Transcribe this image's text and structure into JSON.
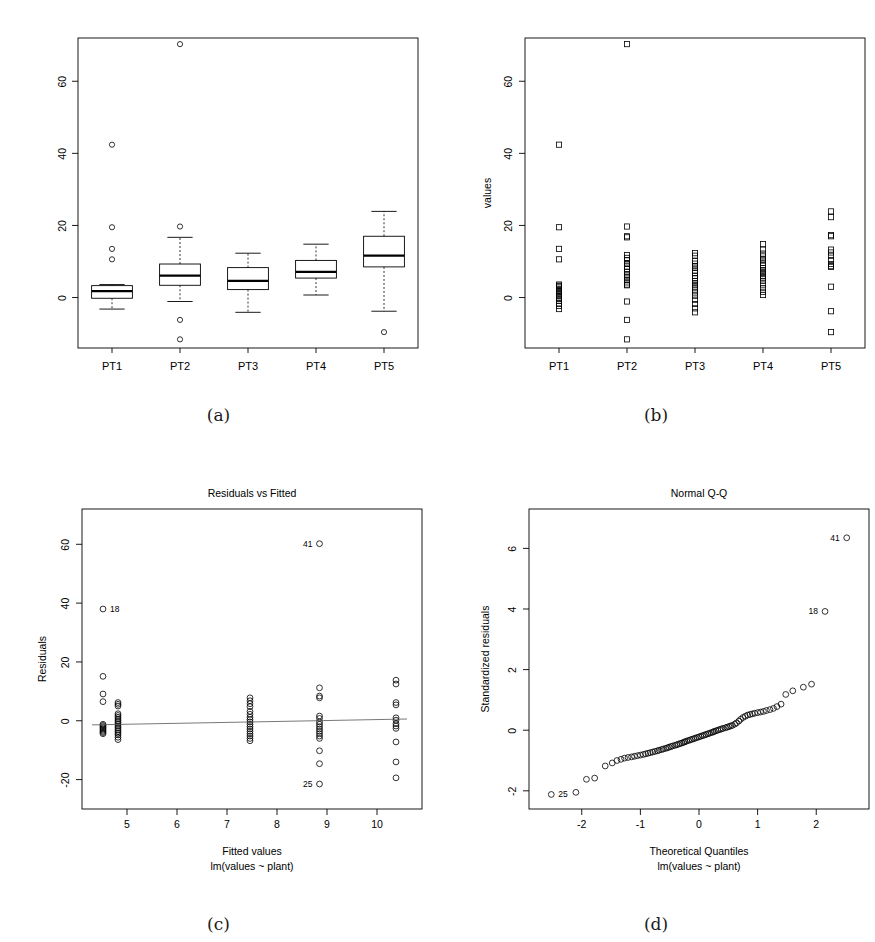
{
  "figure": {
    "caption_a": "(a)",
    "caption_b": "(b)",
    "caption_c": "(c)",
    "caption_d": "(d)"
  },
  "chart_data": [
    {
      "panel": "a",
      "type": "box",
      "title": "",
      "xlabel": "",
      "ylabel": "",
      "categories": [
        "PT1",
        "PT2",
        "PT3",
        "PT4",
        "PT5"
      ],
      "ylim": [
        -14,
        72
      ],
      "yticks": [
        0,
        20,
        40,
        60
      ],
      "ytick_labels": [
        "0",
        "20",
        "40",
        "60"
      ],
      "grid": false,
      "boxes": [
        {
          "category": "PT1",
          "lower_whisker": -3.2,
          "q1": -0.2,
          "median": 1.8,
          "q3": 3.3,
          "upper_whisker": 3.6,
          "outliers": [
            42.4,
            19.5,
            13.5,
            10.6
          ]
        },
        {
          "category": "PT2",
          "lower_whisker": -1.1,
          "q1": 3.4,
          "median": 6.1,
          "q3": 9.3,
          "upper_whisker": 16.7,
          "outliers": [
            70.3,
            19.7,
            -6.2,
            -11.6
          ]
        },
        {
          "category": "PT3",
          "lower_whisker": -4.1,
          "q1": 2.2,
          "median": 4.6,
          "q3": 8.3,
          "upper_whisker": 12.3,
          "outliers": []
        },
        {
          "category": "PT4",
          "lower_whisker": 0.7,
          "q1": 5.4,
          "median": 7.1,
          "q3": 10.3,
          "upper_whisker": 14.8,
          "outliers": []
        },
        {
          "category": "PT5",
          "lower_whisker": -3.8,
          "q1": 8.5,
          "median": 11.6,
          "q3": 17.0,
          "upper_whisker": 23.9,
          "outliers": [
            -9.6
          ]
        }
      ]
    },
    {
      "panel": "b",
      "type": "scatter",
      "title": "",
      "xlabel": "",
      "ylabel": "values",
      "categories": [
        "PT1",
        "PT2",
        "PT3",
        "PT4",
        "PT5"
      ],
      "ylim": [
        -14,
        72
      ],
      "yticks": [
        0,
        20,
        40,
        60
      ],
      "ytick_labels": [
        "0",
        "20",
        "40",
        "60"
      ],
      "grid": false,
      "marker": "square",
      "series": [
        {
          "name": "PT1",
          "values": [
            42.4,
            19.5,
            13.5,
            10.6,
            3.6,
            3.3,
            3.1,
            2.8,
            2.4,
            2.0,
            1.8,
            1.6,
            1.2,
            0.8,
            0.4,
            0.0,
            -0.4,
            -0.9,
            -1.6,
            -2.3,
            -3.2
          ]
        },
        {
          "name": "PT2",
          "values": [
            70.3,
            19.7,
            17.0,
            16.7,
            11.8,
            11.0,
            10.3,
            9.5,
            9.3,
            8.6,
            7.9,
            7.1,
            6.4,
            6.1,
            5.5,
            4.8,
            4.2,
            3.6,
            3.4,
            -1.1,
            -6.2,
            -11.6
          ]
        },
        {
          "name": "PT3",
          "values": [
            12.3,
            11.6,
            10.2,
            9.4,
            8.7,
            8.3,
            7.5,
            6.8,
            6.0,
            5.3,
            4.6,
            4.0,
            3.4,
            2.8,
            2.2,
            1.4,
            0.5,
            -0.6,
            -1.8,
            -3.0,
            -4.1
          ]
        },
        {
          "name": "PT4",
          "values": [
            14.8,
            13.3,
            12.2,
            11.4,
            10.6,
            10.3,
            9.6,
            8.9,
            8.2,
            7.6,
            7.1,
            6.5,
            5.9,
            5.4,
            4.6,
            3.6,
            2.6,
            1.6,
            0.7
          ]
        },
        {
          "name": "PT5",
          "values": [
            23.9,
            22.3,
            17.3,
            17.0,
            13.3,
            12.5,
            11.6,
            10.4,
            9.3,
            8.7,
            8.5,
            3.0,
            -3.8,
            -9.6
          ]
        }
      ]
    },
    {
      "panel": "c",
      "type": "scatter",
      "title": "Residuals vs Fitted",
      "xlabel": "Fitted values",
      "xlabel_sub": "lm(values ~ plant)",
      "ylabel": "Residuals",
      "xlim": [
        4.1,
        10.9
      ],
      "ylim": [
        -30,
        72
      ],
      "xticks": [
        5,
        6,
        7,
        8,
        9,
        10
      ],
      "xtick_labels": [
        "5",
        "6",
        "7",
        "8",
        "9",
        "10"
      ],
      "yticks": [
        -20,
        0,
        20,
        40,
        60
      ],
      "ytick_labels": [
        "-20",
        "0",
        "20",
        "40",
        "60"
      ],
      "grid": false,
      "marker": "circle",
      "lowess_line": [
        [
          4.3,
          -1.4
        ],
        [
          7.5,
          -0.4
        ],
        [
          10.6,
          0.6
        ]
      ],
      "point_labels": [
        {
          "label": "41",
          "x": 8.85,
          "y": 60.2,
          "side": "left"
        },
        {
          "label": "18",
          "x": 4.52,
          "y": 38.0,
          "side": "right"
        },
        {
          "label": "25",
          "x": 8.85,
          "y": -21.5,
          "side": "left"
        }
      ],
      "groups": [
        {
          "fitted": 4.52,
          "residuals": [
            38.0,
            15.1,
            9.1,
            6.5,
            -1.2,
            -1.6,
            -2.0,
            -2.4,
            -2.8,
            -3.2,
            -3.6,
            -4.0,
            -4.4
          ]
        },
        {
          "fitted": 4.82,
          "residuals": [
            6.2,
            5.6,
            5.0,
            2.4,
            1.8,
            1.2,
            0.6,
            0.0,
            -0.6,
            -1.2,
            -1.8,
            -2.4,
            -3.0,
            -3.6,
            -4.2,
            -4.8,
            -5.6,
            -6.4
          ]
        },
        {
          "fitted": 7.46,
          "residuals": [
            7.8,
            6.8,
            5.8,
            4.8,
            3.2,
            2.2,
            1.2,
            0.4,
            -0.4,
            -1.2,
            -2.0,
            -2.8,
            -3.6,
            -4.4,
            -5.2,
            -6.0,
            -6.8
          ]
        },
        {
          "fitted": 8.85,
          "residuals": [
            60.2,
            11.2,
            8.4,
            7.8,
            1.6,
            0.8,
            -0.4,
            -1.2,
            -2.0,
            -2.8,
            -3.6,
            -4.4,
            -5.2,
            -6.0,
            -10.2,
            -14.6,
            -21.5
          ]
        },
        {
          "fitted": 10.38,
          "residuals": [
            13.8,
            12.5,
            6.2,
            5.4,
            1.0,
            0.2,
            -1.0,
            -1.8,
            -2.6,
            -7.2,
            -14.0,
            -19.4
          ]
        }
      ]
    },
    {
      "panel": "d",
      "type": "scatter",
      "title": "Normal Q-Q",
      "xlabel": "Theoretical Quantiles",
      "xlabel_sub": "lm(values ~ plant)",
      "ylabel": "Standardized residuals",
      "xlim": [
        -2.9,
        2.9
      ],
      "ylim": [
        -2.6,
        7.3
      ],
      "xticks": [
        -2,
        -1,
        0,
        1,
        2
      ],
      "xtick_labels": [
        "-2",
        "-1",
        "0",
        "1",
        "2"
      ],
      "yticks": [
        -2,
        0,
        2,
        4,
        6
      ],
      "ytick_labels": [
        "-2",
        "0",
        "2",
        "4",
        "6"
      ],
      "grid": false,
      "marker": "circle",
      "point_labels": [
        {
          "label": "41",
          "x": 2.52,
          "y": 6.35,
          "side": "left"
        },
        {
          "label": "18",
          "x": 2.15,
          "y": 3.92,
          "side": "left"
        },
        {
          "label": "25",
          "x": -2.52,
          "y": -2.12,
          "side": "right"
        }
      ],
      "points_x": [
        -2.52,
        -2.1,
        -1.92,
        -1.78,
        -1.6,
        -1.48,
        -1.4,
        -1.33,
        -1.27,
        -1.21,
        -1.15,
        -1.1,
        -1.05,
        -1.0,
        -0.95,
        -0.91,
        -0.87,
        -0.83,
        -0.79,
        -0.75,
        -0.71,
        -0.68,
        -0.64,
        -0.61,
        -0.57,
        -0.54,
        -0.51,
        -0.48,
        -0.45,
        -0.41,
        -0.38,
        -0.35,
        -0.32,
        -0.29,
        -0.26,
        -0.24,
        -0.21,
        -0.18,
        -0.15,
        -0.12,
        -0.09,
        -0.06,
        -0.03,
        0.0,
        0.03,
        0.06,
        0.09,
        0.12,
        0.15,
        0.18,
        0.21,
        0.24,
        0.26,
        0.29,
        0.32,
        0.35,
        0.38,
        0.41,
        0.45,
        0.48,
        0.51,
        0.54,
        0.57,
        0.61,
        0.64,
        0.68,
        0.71,
        0.75,
        0.79,
        0.83,
        0.87,
        0.91,
        0.95,
        1.0,
        1.05,
        1.1,
        1.15,
        1.21,
        1.27,
        1.33,
        1.4,
        1.48,
        1.6,
        1.78,
        1.92,
        2.15,
        2.52
      ],
      "points_y": [
        -2.12,
        -2.05,
        -1.62,
        -1.58,
        -1.18,
        -1.08,
        -1.0,
        -0.96,
        -0.92,
        -0.9,
        -0.88,
        -0.86,
        -0.84,
        -0.82,
        -0.8,
        -0.78,
        -0.76,
        -0.74,
        -0.72,
        -0.7,
        -0.68,
        -0.66,
        -0.64,
        -0.62,
        -0.6,
        -0.58,
        -0.56,
        -0.54,
        -0.52,
        -0.5,
        -0.48,
        -0.46,
        -0.44,
        -0.42,
        -0.4,
        -0.38,
        -0.36,
        -0.34,
        -0.32,
        -0.3,
        -0.28,
        -0.26,
        -0.24,
        -0.22,
        -0.2,
        -0.18,
        -0.16,
        -0.14,
        -0.12,
        -0.1,
        -0.08,
        -0.06,
        -0.04,
        -0.02,
        0.0,
        0.02,
        0.04,
        0.06,
        0.08,
        0.1,
        0.12,
        0.14,
        0.16,
        0.2,
        0.24,
        0.3,
        0.36,
        0.42,
        0.46,
        0.5,
        0.52,
        0.54,
        0.56,
        0.58,
        0.6,
        0.62,
        0.65,
        0.68,
        0.72,
        0.78,
        0.86,
        1.18,
        1.3,
        1.42,
        1.52,
        3.92,
        6.35
      ]
    }
  ]
}
